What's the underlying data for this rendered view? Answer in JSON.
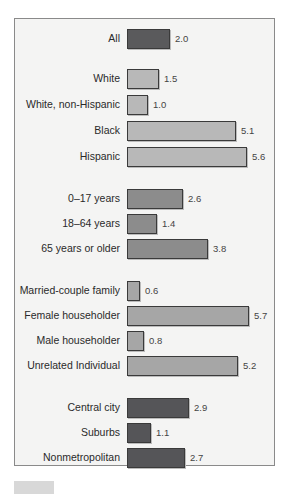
{
  "chart_data": {
    "type": "bar",
    "orientation": "horizontal",
    "title": "",
    "xlabel": "",
    "ylabel": "",
    "grid": false,
    "groups": [
      {
        "name": "Total",
        "categories": [
          "All"
        ],
        "values": [
          2.0
        ],
        "color": "#5a5a5c"
      },
      {
        "name": "Race/Ethnicity",
        "categories": [
          "White",
          "White, non-Hispanic",
          "Black",
          "Hispanic"
        ],
        "values": [
          1.5,
          1.0,
          5.1,
          5.6
        ],
        "color": "#b8b8b8"
      },
      {
        "name": "Age",
        "categories": [
          "0–17 years",
          "18–64 years",
          "65 years or older"
        ],
        "values": [
          2.6,
          1.4,
          3.8
        ],
        "color": "#8c8c8c"
      },
      {
        "name": "Family type",
        "categories": [
          "Married-couple family",
          "Female householder",
          "Male householder",
          "Unrelated Individual"
        ],
        "values": [
          0.6,
          5.7,
          0.8,
          5.2
        ],
        "color": "#a6a6a6"
      },
      {
        "name": "Residence",
        "categories": [
          "Central city",
          "Suburbs",
          "Nonmetropolitan"
        ],
        "values": [
          2.9,
          1.1,
          2.7
        ],
        "color": "#555558"
      }
    ],
    "categories": [
      "All",
      "White",
      "White, non-Hispanic",
      "Black",
      "Hispanic",
      "0–17 years",
      "18–64 years",
      "65 years or older",
      "Married-couple family",
      "Female householder",
      "Male householder",
      "Unrelated Individual",
      "Central city",
      "Suburbs",
      "Nonmetropolitan"
    ],
    "values": [
      2.0,
      1.5,
      1.0,
      5.1,
      5.6,
      2.6,
      1.4,
      3.8,
      0.6,
      5.7,
      0.8,
      5.2,
      2.9,
      1.1,
      2.7
    ],
    "xlim": [
      0,
      6
    ]
  },
  "rows": [
    {
      "label": "All",
      "value": "2.0",
      "v": 2.0,
      "top": 29,
      "cls": "c-dark"
    },
    {
      "label": "White",
      "value": "1.5",
      "v": 1.5,
      "top": 69,
      "cls": "c-light"
    },
    {
      "label": "White, non-Hispanic",
      "value": "1.0",
      "v": 1.0,
      "top": 95,
      "cls": "c-light"
    },
    {
      "label": "Black",
      "value": "5.1",
      "v": 5.1,
      "top": 121,
      "cls": "c-light"
    },
    {
      "label": "Hispanic",
      "value": "5.6",
      "v": 5.6,
      "top": 147,
      "cls": "c-light"
    },
    {
      "label": "0–17 years",
      "value": "2.6",
      "v": 2.6,
      "top": 189,
      "cls": "c-mid"
    },
    {
      "label": "18–64 years",
      "value": "1.4",
      "v": 1.4,
      "top": 214,
      "cls": "c-mid"
    },
    {
      "label": "65 years or older",
      "value": "3.8",
      "v": 3.8,
      "top": 239,
      "cls": "c-mid"
    },
    {
      "label": "Married-couple family",
      "value": "0.6",
      "v": 0.6,
      "top": 281,
      "cls": "c-lmid"
    },
    {
      "label": "Female householder",
      "value": "5.7",
      "v": 5.7,
      "top": 306,
      "cls": "c-lmid"
    },
    {
      "label": "Male householder",
      "value": "0.8",
      "v": 0.8,
      "top": 331,
      "cls": "c-lmid"
    },
    {
      "label": "Unrelated Individual",
      "value": "5.2",
      "v": 5.2,
      "top": 356,
      "cls": "c-lmid"
    },
    {
      "label": "Central city",
      "value": "2.9",
      "v": 2.9,
      "top": 398,
      "cls": "c-region"
    },
    {
      "label": "Suburbs",
      "value": "1.1",
      "v": 1.1,
      "top": 423,
      "cls": "c-region"
    },
    {
      "label": "Nonmetropolitan",
      "value": "2.7",
      "v": 2.7,
      "top": 448,
      "cls": "c-region"
    }
  ]
}
